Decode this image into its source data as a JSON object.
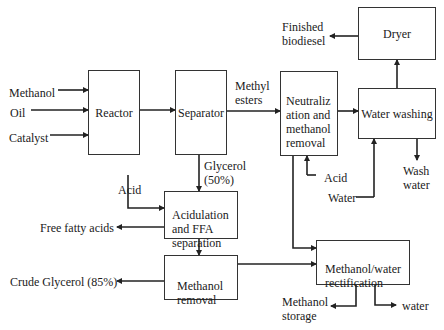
{
  "diagram": {
    "type": "process-flow",
    "boxes": {
      "reactor": "Reactor",
      "separator": "Separator",
      "neutralization": "Neutraliz\nation and\nmethanol\nremoval",
      "water_washing": "Water washing",
      "dryer": "Dryer",
      "acidulation": "Acidulation\nand FFA\nseparation",
      "methanol_removal": "Methanol\nremoval",
      "rectification": "Methanol/water\nrectification"
    },
    "labels": {
      "methanol": "Methanol",
      "oil": "Oil",
      "catalyst": "Catalyst",
      "methyl_esters": "Methyl\nesters",
      "finished_biodiesel": "Finished\nbiodiesel",
      "glycerol": "Glycerol\n(50%)",
      "acid_left": "Acid",
      "acid_right": "Acid",
      "water_in": "Water",
      "wash_water": "Wash\nwater",
      "free_fatty_acids": "Free fatty acids",
      "crude_glycerol": "Crude Glycerol (85%)",
      "methanol_storage": "Methanol\nstorage",
      "water_out": "water"
    },
    "colors": {
      "line": "#222222",
      "box_border": "#333333",
      "background": "#ffffff"
    }
  }
}
